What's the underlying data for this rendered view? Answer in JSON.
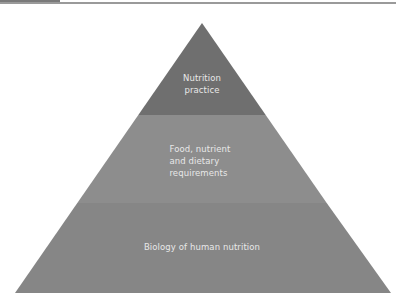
{
  "diagram": {
    "type": "pyramid",
    "tiers": [
      {
        "label": "Nutrition\npractice",
        "color": "#6e6e6e"
      },
      {
        "label": "Food, nutrient\nand dietary\nrequirements",
        "color": "#8c8c8c"
      },
      {
        "label": "Biology of human nutrition",
        "color": "#858585"
      }
    ]
  },
  "colors": {
    "rule": "#9a9a9a",
    "text": "#e8e8e8"
  }
}
